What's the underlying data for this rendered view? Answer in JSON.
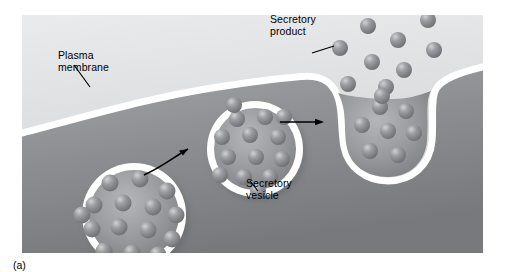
{
  "figure": {
    "caption": "(a)",
    "plate": {
      "x": 22,
      "y": 15,
      "width": 461,
      "height": 238
    }
  },
  "labels": {
    "plasma_membrane": "Plasma\nmembrane",
    "secretory_product": "Secretory\nproduct",
    "secretory_vesicle": "Secretory\nvesicle"
  },
  "colors": {
    "extracellular": "#dcdddf",
    "cytoplasm": "#8e9094",
    "membrane": "#ffffff",
    "granule": "#8a8c90",
    "granule_highlight": "#c9cacc",
    "leader_line": "#000000",
    "page_background": "#ffffff"
  },
  "stages": [
    {
      "name": "free-vesicle",
      "label": "secretory_vesicle",
      "granule_count": 15,
      "cx": 112,
      "cy": 200,
      "r": 52
    },
    {
      "name": "docking-vesicle",
      "label": "secretory_vesicle",
      "granule_count": 14,
      "cx": 233,
      "cy": 134,
      "r": 48
    },
    {
      "name": "fusing-vesicle",
      "label": "secretory_vesicle",
      "granule_count": 8,
      "cx": 375,
      "cy": 122,
      "r": 46
    }
  ],
  "arrows": [
    {
      "name": "arrow-vesicle-to-docking",
      "type": "curved",
      "from": [
        152,
        170
      ],
      "to": [
        190,
        148
      ]
    },
    {
      "name": "arrow-docking-to-fusion",
      "type": "straight",
      "from": [
        288,
        122
      ],
      "to": [
        330,
        122
      ]
    }
  ],
  "released_granules": [
    {
      "x": 340,
      "y": 48
    },
    {
      "x": 368,
      "y": 26
    },
    {
      "x": 398,
      "y": 40
    },
    {
      "x": 428,
      "y": 20
    },
    {
      "x": 372,
      "y": 62
    },
    {
      "x": 404,
      "y": 70
    },
    {
      "x": 434,
      "y": 50
    },
    {
      "x": 348,
      "y": 84
    },
    {
      "x": 382,
      "y": 96
    }
  ]
}
